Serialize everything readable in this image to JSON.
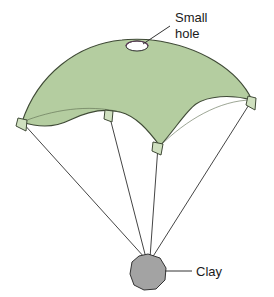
{
  "figure": {
    "background_color": "#ffffff"
  },
  "canopy": {
    "name": "parachute-canopy",
    "fill_color": "#b4cda0",
    "stroke_color": "#3f4a36",
    "stroke_width": 1.1
  },
  "hole": {
    "name": "small-hole",
    "fill_color": "#ffffff",
    "stroke_color": "#2b2b2b",
    "center_x": 137,
    "center_y": 46,
    "radius_x": 11,
    "radius_y": 5
  },
  "clay": {
    "name": "clay-weight",
    "fill_color": "#a3a3a3",
    "stroke_color": "#333333",
    "center_x": 148,
    "center_y": 272,
    "radius": 18
  },
  "cords": {
    "name": "suspension-cords",
    "stroke_color": "#454545",
    "stroke_width": 1,
    "count": 4
  },
  "tabs": {
    "name": "canopy-attachment-tabs",
    "fill_color": "#cfe0bf",
    "stroke_color": "#3f4a36",
    "count": 4
  },
  "labels": {
    "small_hole": {
      "line1": "Small",
      "line2": "hole",
      "x": 175,
      "y": 22,
      "leader_from_x": 170,
      "leader_from_y": 26,
      "leader_to_x": 143,
      "leader_to_y": 44
    },
    "clay": {
      "text": "Clay",
      "x": 196,
      "y": 276,
      "leader_from_x": 165,
      "leader_from_y": 271,
      "leader_to_x": 192,
      "leader_to_y": 271
    }
  }
}
